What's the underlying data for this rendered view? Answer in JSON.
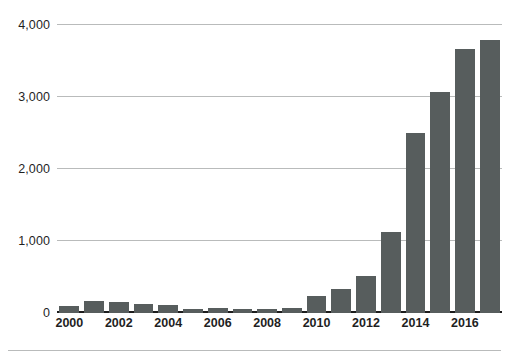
{
  "chart_data": {
    "type": "bar",
    "title": "",
    "subtitle": "",
    "xlabel": "",
    "ylabel": "",
    "categories": [
      "2000",
      "2001",
      "2002",
      "2003",
      "2004",
      "2005",
      "2006",
      "2007",
      "2008",
      "2009",
      "2010",
      "2011",
      "2012",
      "2013",
      "2014",
      "2015",
      "2016",
      "2017"
    ],
    "values": [
      100,
      170,
      155,
      125,
      110,
      60,
      65,
      60,
      60,
      65,
      230,
      330,
      520,
      1120,
      2500,
      3070,
      3660,
      3790
    ],
    "ylim": [
      0,
      4000
    ],
    "y_ticks": [
      0,
      1000,
      2000,
      3000,
      4000
    ],
    "y_tick_labels": [
      "0",
      "1,000",
      "2,000",
      "3,000",
      "4,000"
    ],
    "x_tick_labels": [
      "2000",
      "2002",
      "2004",
      "2006",
      "2008",
      "2010",
      "2012",
      "2014",
      "2016"
    ],
    "x_tick_categories": [
      "2000",
      "2002",
      "2004",
      "2006",
      "2008",
      "2010",
      "2012",
      "2014",
      "2016"
    ],
    "grid": true,
    "legend": null,
    "legend_position": "none",
    "series": [
      {
        "name": "",
        "values": [
          100,
          170,
          155,
          125,
          110,
          60,
          65,
          60,
          60,
          65,
          230,
          330,
          520,
          1120,
          2500,
          3070,
          3660,
          3790
        ]
      }
    ],
    "colors": {
      "bar": "#575d5d",
      "gridline": "#b9bbbb",
      "axis": "#1c1c1c",
      "background": "#ffffff",
      "text": "#1f1f1f"
    }
  }
}
